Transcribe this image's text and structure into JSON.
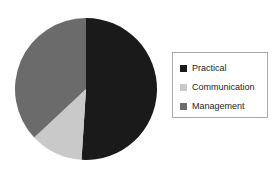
{
  "background_color": "#ffffff",
  "chart_data": {
    "type": "pie",
    "title": "",
    "subtitle": "",
    "xlabel": "",
    "ylabel": "",
    "grid": false,
    "legend_position": "right",
    "categories": [
      "Practical",
      "Communication",
      "Management"
    ],
    "values": [
      51,
      12,
      37
    ],
    "units": "percent",
    "start_angle_deg": 0,
    "direction": "clockwise",
    "colors": [
      "#1a1a1a",
      "#c9c9c9",
      "#6b6b6b"
    ],
    "slices": [
      {
        "label": "Practical",
        "value": 51,
        "color": "#1a1a1a",
        "start_angle_deg": 0,
        "end_angle_deg": 183.6
      },
      {
        "label": "Communication",
        "value": 12,
        "color": "#c9c9c9",
        "start_angle_deg": 183.6,
        "end_angle_deg": 226.8
      },
      {
        "label": "Management",
        "value": 37,
        "color": "#6b6b6b",
        "start_angle_deg": 226.8,
        "end_angle_deg": 360
      }
    ],
    "geometry": {
      "center_x": 72,
      "center_y": 72,
      "radius": 71
    }
  },
  "legend": {
    "border_color": "#a8a8a8",
    "background": "#ffffff",
    "items": [
      {
        "label": "Practical",
        "color": "#1a1a1a"
      },
      {
        "label": "Communication",
        "color": "#c9c9c9"
      },
      {
        "label": "Management",
        "color": "#6b6b6b"
      }
    ]
  }
}
